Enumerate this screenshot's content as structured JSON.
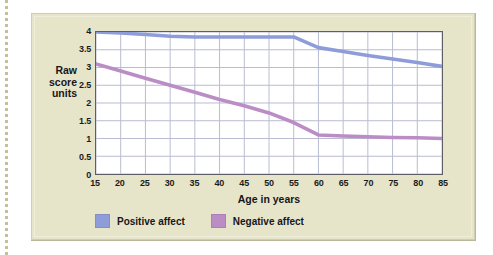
{
  "chart_data": {
    "type": "line",
    "title": "",
    "xlabel": "Age in years",
    "ylabel": "Raw score units",
    "ylabel_lines": [
      "Raw",
      "score",
      "units"
    ],
    "x": [
      15,
      20,
      25,
      30,
      35,
      40,
      45,
      50,
      55,
      60,
      65,
      70,
      75,
      80,
      85
    ],
    "xticks": [
      "15",
      "20",
      "25",
      "30",
      "35",
      "40",
      "45",
      "50",
      "55",
      "60",
      "65",
      "70",
      "75",
      "80",
      "85"
    ],
    "yticks": [
      "0",
      "0.5",
      "1",
      "1.5",
      "2",
      "2.5",
      "3",
      "3.5",
      "4"
    ],
    "ytick_values": [
      0,
      0.5,
      1,
      1.5,
      2,
      2.5,
      3,
      3.5,
      4
    ],
    "xlim": [
      15,
      85
    ],
    "ylim": [
      0,
      4
    ],
    "grid": true,
    "legend_position": "bottom-left",
    "series": [
      {
        "name": "Positive affect",
        "color": "#8e9cd9",
        "values": [
          4.0,
          3.97,
          3.93,
          3.88,
          3.86,
          3.86,
          3.86,
          3.86,
          3.86,
          3.56,
          3.45,
          3.34,
          3.24,
          3.14,
          3.03
        ]
      },
      {
        "name": "Negative affect",
        "color": "#ba8dc5",
        "values": [
          3.1,
          2.9,
          2.7,
          2.5,
          2.3,
          2.1,
          1.92,
          1.72,
          1.45,
          1.1,
          1.07,
          1.05,
          1.03,
          1.02,
          1.0
        ]
      }
    ]
  },
  "legend": {
    "items": [
      {
        "label": "Positive affect",
        "color": "#8e9cd9"
      },
      {
        "label": "Negative affect",
        "color": "#ba8dc5"
      }
    ]
  },
  "colors": {
    "panel_background": "#e6e5ca",
    "plot_background": "#ffffff",
    "grid_line": "#b9bcd2",
    "axis_line": "#5e5e66",
    "positive_affect": "#8e9cd9",
    "negative_affect": "#ba8dc5",
    "dotted_rule": "#c9bd9a"
  }
}
